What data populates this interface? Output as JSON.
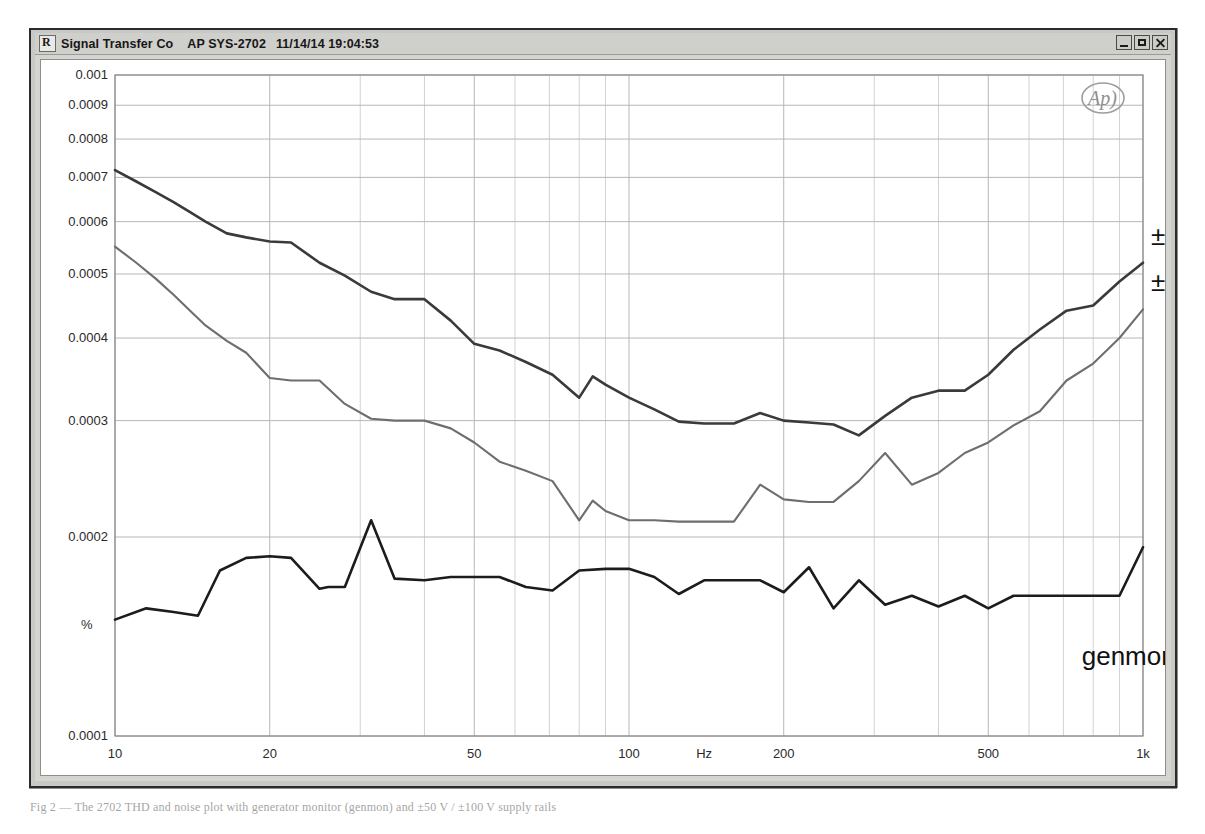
{
  "window": {
    "title_company": "Signal Transfer Co",
    "title_model": "AP SYS-2702",
    "title_timestamp": "11/14/14 19:04:53",
    "app_icon": "app-icon",
    "buttons": {
      "minimize": "minimize-button",
      "maximize": "maximize-button",
      "close": "close-button"
    }
  },
  "logo": {
    "name": "ap-logo",
    "text": "Ap)"
  },
  "caption": {
    "text": "Fig 2 — The 2702 THD and noise plot with generator monitor (genmon) and ±50 V / ±100 V supply rails"
  },
  "chart_data": {
    "type": "line",
    "title": "",
    "xlabel": "Hz",
    "ylabel": "%",
    "xscale": "log",
    "yscale": "log",
    "xlim": [
      10,
      1000
    ],
    "ylim": [
      0.0001,
      0.001
    ],
    "grid": true,
    "legend_position": "inline-right",
    "xticks": [
      10,
      20,
      50,
      100,
      200,
      500,
      1000
    ],
    "xticklabels": [
      "10",
      "20",
      "50",
      "100",
      "200",
      "500",
      "1k"
    ],
    "yticks": [
      0.0001,
      0.0002,
      0.0003,
      0.0004,
      0.0005,
      0.0006,
      0.0007,
      0.0008,
      0.0009,
      0.001
    ],
    "yticklabels": [
      "0.0001",
      "0.0002",
      "0.0003",
      "0.0004",
      "0.0005",
      "0.0006",
      "0.0007",
      "0.0008",
      "0.0009",
      "0.001"
    ],
    "series": [
      {
        "name": "±100",
        "label": "±100",
        "color": "#3a3a3a",
        "width": 2.6,
        "label_x": 1000,
        "label_y": 0.00057,
        "x": [
          10,
          11,
          12,
          13,
          14,
          15,
          16.5,
          18,
          20,
          22,
          25,
          28,
          31.5,
          35,
          40,
          45,
          50,
          56,
          63,
          71,
          80,
          85,
          90,
          100,
          112,
          125,
          140,
          160,
          180,
          200,
          224,
          250,
          280,
          315,
          355,
          400,
          450,
          500,
          560,
          630,
          710,
          800,
          900,
          1000
        ],
        "y": [
          0.000718,
          0.00069,
          0.000665,
          0.000642,
          0.00062,
          0.0006,
          0.000576,
          0.000568,
          0.00056,
          0.000558,
          0.00052,
          0.000497,
          0.00047,
          0.000458,
          0.000458,
          0.000425,
          0.000392,
          0.000383,
          0.000368,
          0.000352,
          0.000325,
          0.00035,
          0.00034,
          0.000325,
          0.000312,
          0.000299,
          0.000297,
          0.000297,
          0.000308,
          0.0003,
          0.000298,
          0.000296,
          0.000285,
          0.000305,
          0.000325,
          0.000333,
          0.000333,
          0.000352,
          0.000384,
          0.000412,
          0.00044,
          0.000448,
          0.000487,
          0.00052
        ]
      },
      {
        "name": "±50",
        "label": "±50",
        "color": "#6e6e6e",
        "width": 2.1,
        "label_x": 1000,
        "label_y": 0.000487,
        "x": [
          10,
          11,
          12,
          13,
          14,
          15,
          16.5,
          18,
          20,
          22,
          25,
          28,
          31.5,
          35,
          40,
          45,
          50,
          56,
          63,
          71,
          80,
          85,
          90,
          100,
          112,
          125,
          140,
          160,
          180,
          200,
          224,
          250,
          280,
          315,
          355,
          400,
          450,
          500,
          560,
          630,
          710,
          800,
          900,
          1000
        ],
        "y": [
          0.00055,
          0.00052,
          0.000492,
          0.000465,
          0.00044,
          0.000418,
          0.000396,
          0.00038,
          0.000348,
          0.000345,
          0.000345,
          0.000318,
          0.000302,
          0.0003,
          0.0003,
          0.000292,
          0.000278,
          0.00026,
          0.000252,
          0.000243,
          0.000212,
          0.000227,
          0.000219,
          0.000212,
          0.000212,
          0.000211,
          0.000211,
          0.000211,
          0.00024,
          0.000228,
          0.000226,
          0.000226,
          0.000243,
          0.000268,
          0.00024,
          0.00025,
          0.000268,
          0.000278,
          0.000295,
          0.00031,
          0.000345,
          0.000366,
          0.0004,
          0.000442
        ]
      },
      {
        "name": "genmon",
        "label": "genmon",
        "color": "#1c1c1c",
        "width": 2.6,
        "label_x": 760,
        "label_y": 0.000132,
        "x": [
          10,
          11.5,
          13,
          14.5,
          16,
          18,
          20,
          22,
          25,
          26,
          28,
          31.5,
          35,
          40,
          45,
          50,
          56,
          63,
          71,
          80,
          90,
          100,
          112,
          125,
          140,
          160,
          180,
          200,
          224,
          250,
          280,
          315,
          355,
          400,
          450,
          500,
          560,
          630,
          710,
          800,
          900,
          1000
        ],
        "y": [
          0.00015,
          0.000156,
          0.000154,
          0.000152,
          0.000178,
          0.000186,
          0.000187,
          0.000186,
          0.000167,
          0.000168,
          0.000168,
          0.000212,
          0.000173,
          0.000172,
          0.000174,
          0.000174,
          0.000174,
          0.000168,
          0.000166,
          0.000178,
          0.000179,
          0.000179,
          0.000174,
          0.000164,
          0.000172,
          0.000172,
          0.000172,
          0.000165,
          0.00018,
          0.000156,
          0.000172,
          0.000158,
          0.000163,
          0.000157,
          0.000163,
          0.000156,
          0.000163,
          0.000163,
          0.000163,
          0.000163,
          0.000163,
          0.000193
        ]
      }
    ]
  }
}
